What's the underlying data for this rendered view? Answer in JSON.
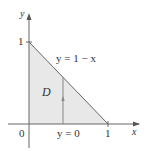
{
  "diagram": {
    "type": "region-plot",
    "region_label": "D",
    "curves": [
      {
        "name": "hypotenuse",
        "equation": "y = 1 − x",
        "label": "y = 1 − x"
      },
      {
        "name": "bottom",
        "equation": "y = 0",
        "label": "y = 0"
      }
    ],
    "axes": {
      "x_label": "x",
      "y_label": "y",
      "origin_label": "0",
      "x_tick": "1",
      "y_tick": "1"
    },
    "region_fill": "#e6e6e6",
    "line_color": "#555555"
  }
}
